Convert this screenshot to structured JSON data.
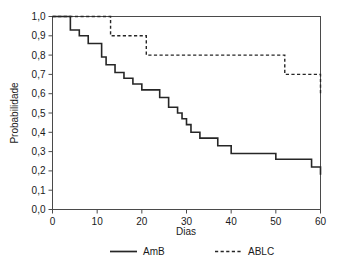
{
  "chart_data": {
    "type": "line",
    "title": "",
    "xlabel": "Dias",
    "ylabel": "Probabilidade",
    "xlim": [
      0,
      60
    ],
    "ylim": [
      0.0,
      1.0
    ],
    "xticks": [
      0,
      10,
      20,
      30,
      40,
      50,
      60
    ],
    "xtick_labels": [
      "0",
      "10",
      "20",
      "30",
      "40",
      "50",
      "60"
    ],
    "yticks": [
      0.0,
      0.1,
      0.2,
      0.3,
      0.4,
      0.5,
      0.6,
      0.7,
      0.8,
      0.9,
      1.0
    ],
    "ytick_labels": [
      "0,0",
      "0,1",
      "0,2",
      "0,3",
      "0,4",
      "0,5",
      "0,6",
      "0,7",
      "0,8",
      "0,9",
      "1,0"
    ],
    "grid": false,
    "legend_position": "bottom",
    "decimal_separator": ",",
    "series": [
      {
        "name": "AmB",
        "style": "solid",
        "color": "#262626",
        "step": "post",
        "x": [
          0,
          4,
          4,
          6,
          8,
          10,
          11,
          12,
          14,
          16,
          18,
          20,
          23,
          24,
          26,
          28,
          29,
          30,
          31,
          33,
          36,
          37,
          40,
          43,
          50,
          58,
          60
        ],
        "y": [
          1.0,
          1.0,
          0.93,
          0.9,
          0.86,
          0.86,
          0.79,
          0.75,
          0.71,
          0.68,
          0.65,
          0.62,
          0.62,
          0.58,
          0.53,
          0.5,
          0.47,
          0.44,
          0.4,
          0.37,
          0.37,
          0.33,
          0.29,
          0.29,
          0.26,
          0.22,
          0.18
        ]
      },
      {
        "name": "ABLC",
        "style": "dashed",
        "color": "#262626",
        "step": "post",
        "x": [
          0,
          11,
          13,
          21,
          52,
          60
        ],
        "y": [
          1.0,
          1.0,
          0.9,
          0.8,
          0.7,
          0.6
        ]
      }
    ]
  },
  "legend": {
    "items": [
      {
        "label": "AmB",
        "style": "solid"
      },
      {
        "label": "ABLC",
        "style": "dashed"
      }
    ]
  }
}
